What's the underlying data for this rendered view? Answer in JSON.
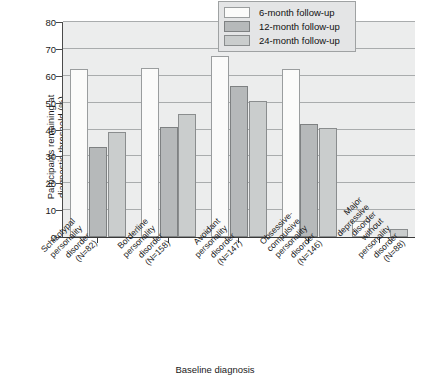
{
  "chart_data": {
    "type": "bar",
    "title": "",
    "xlabel": "Baseline diagnosis",
    "ylabel": "Participants remaining at\ndiagnostic threshold (%)",
    "ylim": [
      0,
      80
    ],
    "yticks": [
      0,
      10,
      20,
      30,
      40,
      50,
      60,
      70,
      80
    ],
    "grid": true,
    "legend_position": "top-right",
    "categories": [
      "Schizotypal personality\ndisorder (N=82)",
      "Borderline personality\ndisorder (N=158)",
      "Avoidant personality\ndisorder (N=147)",
      "Obsessive-compulsive\npersonality disorder (N=146)",
      "Major depressive\ndisorder without personality\ndisorder (N=88)"
    ],
    "series": [
      {
        "name": "6-month follow-up",
        "color": "#fbfbfa",
        "values": [
          62.5,
          63.0,
          67.3,
          62.5,
          6.0
        ]
      },
      {
        "name": "12-month follow-up",
        "color": "#b6b9ba",
        "values": [
          33.5,
          41.0,
          56.2,
          42.0,
          0.0
        ]
      },
      {
        "name": "24-month follow-up",
        "color": "#cacdcd",
        "values": [
          39.2,
          45.8,
          50.5,
          40.5,
          3.0
        ]
      }
    ]
  },
  "legend": {
    "items": [
      {
        "label": "6-month follow-up"
      },
      {
        "label": "12-month follow-up"
      },
      {
        "label": "24-month follow-up"
      }
    ]
  },
  "axes": {
    "y_title": "Participants remaining at\ndiagnostic threshold (%)",
    "x_title": "Baseline diagnosis",
    "y_tick_labels": [
      "80",
      "70",
      "60",
      "50",
      "40",
      "30",
      "20",
      "10",
      "0"
    ]
  }
}
